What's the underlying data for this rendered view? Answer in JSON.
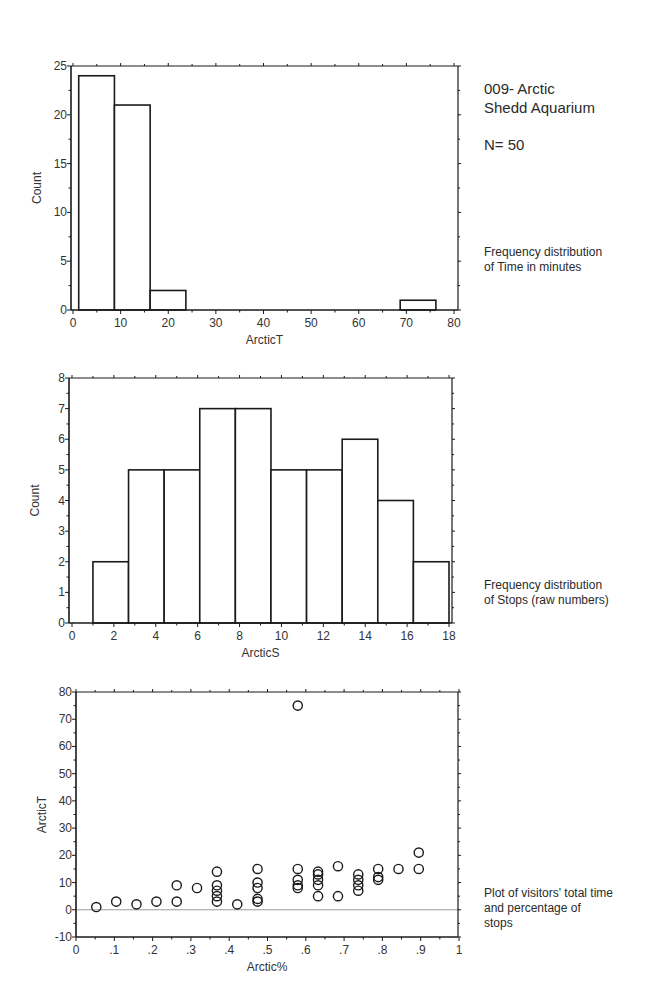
{
  "header": {
    "title_line1": "009- Arctic",
    "title_line2": "Shedd Aquarium",
    "n_label": "N= 50"
  },
  "notes": {
    "chart1_line1": "Frequency distribution",
    "chart1_line2": "of Time in minutes",
    "chart2_line1": "Frequency distribution",
    "chart2_line2": "of Stops (raw numbers)",
    "chart3_line1": "Plot of visitors' total time",
    "chart3_line2": "and percentage of",
    "chart3_line3": "stops"
  },
  "colors": {
    "line": "#1a1a1a",
    "text": "#333333",
    "zero_line": "#9a9a9a",
    "background": "#ffffff"
  },
  "chart_data": [
    {
      "type": "bar",
      "subtype": "histogram",
      "title": "Frequency distribution of Time in minutes",
      "xlabel": "ArcticT",
      "ylabel": "Count",
      "xlim": [
        0,
        80
      ],
      "ylim": [
        0,
        25
      ],
      "xticks": [
        0,
        10,
        20,
        30,
        40,
        50,
        60,
        70,
        80
      ],
      "yticks": [
        0,
        5,
        10,
        15,
        20,
        25
      ],
      "bin_edges": [
        1.2,
        8.7,
        16.2,
        23.7,
        31.2,
        38.7,
        46.2,
        53.7,
        61.2,
        68.7,
        76.2
      ],
      "values": [
        24,
        21,
        2,
        0,
        0,
        0,
        0,
        0,
        0,
        1
      ],
      "grid": false,
      "frame": {
        "left": 71,
        "top": 66,
        "right": 458,
        "bottom": 310,
        "x0px": 73,
        "x1px": 454
      }
    },
    {
      "type": "bar",
      "subtype": "histogram",
      "title": "Frequency distribution of Stops (raw numbers)",
      "xlabel": "ArcticS",
      "ylabel": "Count",
      "xlim": [
        0,
        18
      ],
      "ylim": [
        0,
        8
      ],
      "xticks": [
        0,
        2,
        4,
        6,
        8,
        10,
        12,
        14,
        16,
        18
      ],
      "yticks": [
        0,
        1,
        2,
        3,
        4,
        5,
        6,
        7,
        8
      ],
      "bin_edges": [
        1.0,
        2.7,
        4.4,
        6.1,
        7.8,
        9.5,
        11.2,
        12.9,
        14.6,
        16.3,
        18.0
      ],
      "values": [
        2,
        5,
        5,
        7,
        7,
        5,
        5,
        6,
        4,
        2
      ],
      "grid": false,
      "frame": {
        "left": 69,
        "top": 378,
        "right": 452,
        "bottom": 623,
        "x0px": 72,
        "x1px": 449
      }
    },
    {
      "type": "scatter",
      "title": "Plot of visitors' total time and percentage of stops",
      "xlabel": "Arctic%",
      "ylabel": "ArcticT",
      "xlim": [
        0,
        1
      ],
      "ylim": [
        -10,
        80
      ],
      "xticks": [
        0,
        0.1,
        0.2,
        0.3,
        0.4,
        0.5,
        0.6,
        0.7,
        0.8,
        0.9,
        1
      ],
      "xtick_labels": [
        "0",
        ".1",
        ".2",
        ".3",
        ".4",
        ".5",
        ".6",
        ".7",
        ".8",
        ".9",
        "1"
      ],
      "yticks": [
        -10,
        0,
        10,
        20,
        30,
        40,
        50,
        60,
        70,
        80
      ],
      "zero_line": true,
      "grid": false,
      "points": [
        {
          "x": 0.053,
          "y": 1
        },
        {
          "x": 0.105,
          "y": 3
        },
        {
          "x": 0.158,
          "y": 2
        },
        {
          "x": 0.21,
          "y": 3
        },
        {
          "x": 0.263,
          "y": 9
        },
        {
          "x": 0.263,
          "y": 3
        },
        {
          "x": 0.316,
          "y": 8
        },
        {
          "x": 0.368,
          "y": 14
        },
        {
          "x": 0.368,
          "y": 9
        },
        {
          "x": 0.368,
          "y": 7
        },
        {
          "x": 0.368,
          "y": 5
        },
        {
          "x": 0.368,
          "y": 3
        },
        {
          "x": 0.421,
          "y": 2
        },
        {
          "x": 0.474,
          "y": 15
        },
        {
          "x": 0.474,
          "y": 10
        },
        {
          "x": 0.474,
          "y": 8
        },
        {
          "x": 0.474,
          "y": 4
        },
        {
          "x": 0.474,
          "y": 3
        },
        {
          "x": 0.579,
          "y": 75
        },
        {
          "x": 0.579,
          "y": 15
        },
        {
          "x": 0.579,
          "y": 11
        },
        {
          "x": 0.579,
          "y": 9
        },
        {
          "x": 0.579,
          "y": 8
        },
        {
          "x": 0.632,
          "y": 14
        },
        {
          "x": 0.632,
          "y": 13
        },
        {
          "x": 0.632,
          "y": 11
        },
        {
          "x": 0.632,
          "y": 9
        },
        {
          "x": 0.632,
          "y": 5
        },
        {
          "x": 0.684,
          "y": 16
        },
        {
          "x": 0.684,
          "y": 5
        },
        {
          "x": 0.737,
          "y": 13
        },
        {
          "x": 0.737,
          "y": 11
        },
        {
          "x": 0.737,
          "y": 9
        },
        {
          "x": 0.737,
          "y": 7
        },
        {
          "x": 0.789,
          "y": 15
        },
        {
          "x": 0.789,
          "y": 12
        },
        {
          "x": 0.789,
          "y": 11
        },
        {
          "x": 0.842,
          "y": 15
        },
        {
          "x": 0.895,
          "y": 21
        },
        {
          "x": 0.895,
          "y": 15
        }
      ],
      "frame": {
        "left": 76,
        "top": 692,
        "right": 458,
        "bottom": 937,
        "x0px": 76,
        "x1px": 459
      }
    }
  ]
}
